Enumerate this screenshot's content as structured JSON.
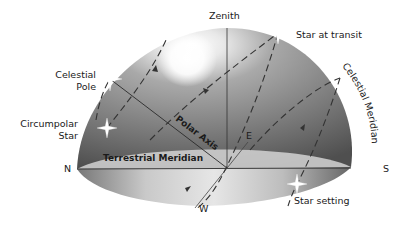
{
  "diagram": {
    "type": "celestial-sphere",
    "colors": {
      "dome_dark": "#5e5e5e",
      "dome_mid": "#8a8a8a",
      "dome_light": "#cfcfcf",
      "highlight": "#ffffff",
      "horizon_disc": "#d8d8d8",
      "line": "#2a2a2a",
      "text": "#1a1a1a"
    },
    "labels": {
      "zenith": "Zenith",
      "star_at_transit": "Star at transit",
      "celestial_pole_line1": "Celestial",
      "celestial_pole_line2": "Pole",
      "circumpolar_star_line1": "Circumpolar",
      "circumpolar_star_line2": "Star",
      "polar_axis": "Polar Axis",
      "terrestrial_meridian": "Terrestrial Meridian",
      "celestial_meridian": "Celestial Meridian",
      "east": "E",
      "west": "W",
      "north": "N",
      "south": "S",
      "star_setting": "Star setting"
    },
    "stars": [
      {
        "name": "celestial-pole",
        "x": 110,
        "y": 79
      },
      {
        "name": "circumpolar-star",
        "x": 107,
        "y": 128
      },
      {
        "name": "star-at-transit",
        "x": 278,
        "y": 33
      },
      {
        "name": "star-setting",
        "x": 297,
        "y": 184
      }
    ]
  }
}
